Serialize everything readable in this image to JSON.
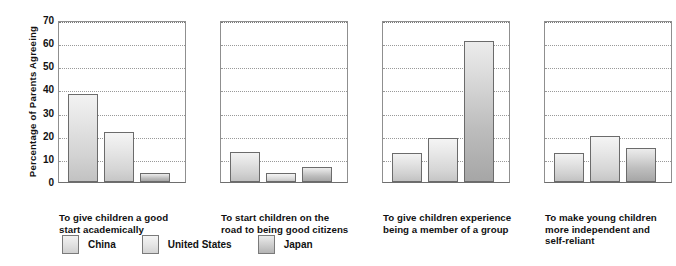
{
  "chart_data": {
    "type": "bar",
    "title": "",
    "subtitle": "",
    "xlabel": "",
    "ylabel": "Percentage of Parents Agreeing",
    "ylim": [
      0,
      70
    ],
    "ytick_step": 10,
    "yticks": [
      70,
      60,
      50,
      40,
      30,
      20,
      10,
      0
    ],
    "grid": "horizontal-dotted",
    "legend_position": "bottom-left",
    "layout": "small-multiples-4-panels",
    "categories": [
      "To give children a good start academically",
      "To start children on the road to being good citizens",
      "To give children experience being a member of a group",
      "To make young children more independent and self-reliant"
    ],
    "series": [
      {
        "name": "China",
        "values": [
          38,
          13,
          12.5,
          12.5
        ]
      },
      {
        "name": "United States",
        "values": [
          21.5,
          4,
          19,
          20
        ]
      },
      {
        "name": "Japan",
        "values": [
          4,
          6.5,
          61,
          14.5
        ]
      }
    ]
  },
  "axis": {
    "y_title": "Percentage of Parents Agreeing",
    "ticks": [
      "70",
      "60",
      "50",
      "40",
      "30",
      "20",
      "10",
      "0"
    ]
  },
  "panels": [
    {
      "id": "panel-academic-start",
      "caption_lines": [
        "To give children a good",
        "start academically"
      ],
      "bars": [
        {
          "series": "China",
          "value": 38
        },
        {
          "series": "United States",
          "value": 21.5
        },
        {
          "series": "Japan",
          "value": 4
        }
      ]
    },
    {
      "id": "panel-good-citizens",
      "caption_lines": [
        "To start children on the",
        "road to being good citizens"
      ],
      "bars": [
        {
          "series": "China",
          "value": 13
        },
        {
          "series": "United States",
          "value": 4
        },
        {
          "series": "Japan",
          "value": 6.5
        }
      ]
    },
    {
      "id": "panel-group-member",
      "caption_lines": [
        "To give children experience",
        "being a member of a group"
      ],
      "bars": [
        {
          "series": "China",
          "value": 12.5
        },
        {
          "series": "United States",
          "value": 19
        },
        {
          "series": "Japan",
          "value": 61
        }
      ]
    },
    {
      "id": "panel-independent",
      "caption_lines": [
        "To make young children",
        "more independent and",
        "self-reliant"
      ],
      "bars": [
        {
          "series": "China",
          "value": 12.5
        },
        {
          "series": "United States",
          "value": 20
        },
        {
          "series": "Japan",
          "value": 14.5
        }
      ]
    }
  ],
  "legend": {
    "items": [
      {
        "label": "China",
        "swatch": "s-china"
      },
      {
        "label": "United States",
        "swatch": "s-us"
      },
      {
        "label": "Japan",
        "swatch": "s-japan"
      }
    ]
  },
  "colors": {
    "bar_china_top": "#f2f2f2",
    "bar_china_bottom": "#c2c2c2",
    "bar_us_top": "#f4f4f4",
    "bar_us_bottom": "#c6c6c6",
    "bar_japan_top": "#ececec",
    "bar_japan_bottom": "#a6a6a6",
    "bar_outline": "#6b6b6b",
    "axis": "#8f8f8f",
    "gridline": "#999999",
    "text": "#111111",
    "background": "#ffffff"
  }
}
